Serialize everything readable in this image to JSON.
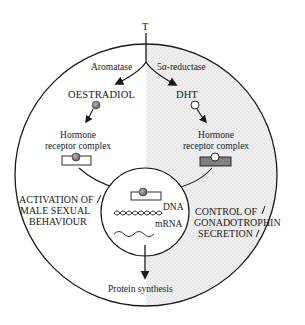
{
  "diagram": {
    "top_label": "T",
    "enzymes": {
      "left": "Aromatase",
      "right": "5α-reductase"
    },
    "products": {
      "left": "OESTRADIOL",
      "right": "DHT"
    },
    "receptor_complex": {
      "left_line1": "Hormone",
      "left_line2": "receptor complex",
      "right_line1": "Hormone",
      "right_line2": "receptor complex"
    },
    "nucleus": {
      "dna_label": "DNA",
      "mrna_label": "mRNA"
    },
    "effects": {
      "left_line1": "ACTIVATION OF",
      "left_line2": "MALE SEXUAL",
      "left_line3": "BEHAVIOUR",
      "right_line1": "CONTROL OF",
      "right_line2": "GONADOTROPHIN",
      "right_line3": "SECRETION"
    },
    "output": "Protein synthesis",
    "colors": {
      "line": "#1a1a1a",
      "stipple_bg": "#ececec",
      "stipple_dot": "#b5b5b5",
      "oestradiol_fill": "#8a8a8a",
      "dht_fill": "#ffffff",
      "receptor_dark": "#7a7a7a"
    }
  }
}
